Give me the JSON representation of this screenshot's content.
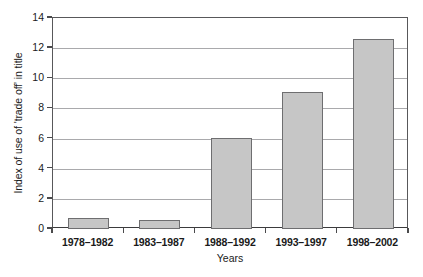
{
  "chart_data": {
    "type": "bar",
    "title": "",
    "subtitle": "",
    "xlabel": "Years",
    "ylabel": "Index of use of 'trade off' in title",
    "categories": [
      "1978–1982",
      "1983–1987",
      "1988–1992",
      "1993–1997",
      "1998–2002"
    ],
    "values": [
      0.7,
      0.6,
      6.05,
      9.1,
      12.6
    ],
    "ylim": [
      0,
      14
    ],
    "yticks": [
      0,
      2,
      4,
      6,
      8,
      10,
      12,
      14
    ],
    "ytick_labels": [
      "0",
      "2",
      "4",
      "6",
      "8",
      "10",
      "12",
      "14"
    ],
    "grid": "horizontal",
    "legend": "none",
    "series": [
      {
        "name": "Index of use of 'trade off' in title",
        "values": [
          0.7,
          0.6,
          6.05,
          9.1,
          12.6
        ]
      }
    ],
    "annotations": []
  },
  "style": {
    "bar_fill": "#c6c6c6",
    "bar_border": "#6e6e70",
    "gridline_color": "#a9a9ac",
    "axis_color": "#4a4a4c",
    "text_color": "#1a1a1a",
    "background": "#ffffff"
  }
}
